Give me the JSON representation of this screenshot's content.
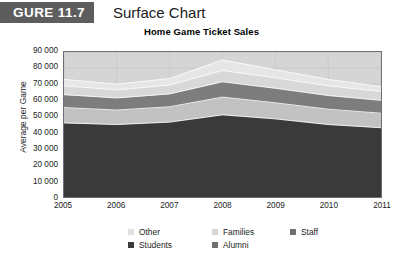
{
  "figure": {
    "number_label": "GURE 11.7",
    "title": "Surface Chart"
  },
  "chart_data": {
    "type": "area",
    "title": "Home Game Ticket Sales",
    "xlabel": "",
    "ylabel": "Average per Game",
    "categories": [
      "2005",
      "2006",
      "2007",
      "2008",
      "2009",
      "2010",
      "2011"
    ],
    "ylim": [
      0,
      90000
    ],
    "ytick_step": 10000,
    "yticks": [
      "0",
      "10 000",
      "20 000",
      "30 000",
      "40 000",
      "50 000",
      "60 000",
      "70 000",
      "80 000",
      "90 000"
    ],
    "grid": true,
    "legend_position": "bottom",
    "stack_order_bottom_to_top": [
      "Students",
      "Alumni",
      "Staff",
      "Families",
      "Other"
    ],
    "series": [
      {
        "name": "Students",
        "color": "#3a3a3a",
        "values": [
          46000,
          45000,
          46500,
          51000,
          48500,
          45000,
          43000
        ]
      },
      {
        "name": "Alumni",
        "color": "#c2c2c2",
        "values": [
          9500,
          9000,
          9500,
          11000,
          10000,
          9500,
          9000
        ]
      },
      {
        "name": "Staff",
        "color": "#7d7d7d",
        "values": [
          8000,
          7500,
          8000,
          9500,
          9000,
          8500,
          8000
        ]
      },
      {
        "name": "Families",
        "color": "#d8d8d8",
        "values": [
          5500,
          5000,
          5500,
          7000,
          6500,
          6000,
          5500
        ]
      },
      {
        "name": "Other",
        "color": "#e6e6e6",
        "values": [
          4000,
          3500,
          4000,
          6500,
          5000,
          4000,
          3000
        ]
      }
    ],
    "totals": [
      73000,
      70000,
      73500,
      85000,
      79000,
      73000,
      68500
    ]
  },
  "legend": {
    "columns": [
      {
        "items": [
          {
            "label": "Other",
            "color": "#e0e0e0"
          },
          {
            "label": "Students",
            "color": "#3a3a3a"
          }
        ]
      },
      {
        "items": [
          {
            "label": "Families",
            "color": "#d6d6d6"
          },
          {
            "label": "Alumni",
            "color": "#6f6f6f"
          }
        ]
      },
      {
        "items": [
          {
            "label": "Staff",
            "color": "#707070"
          }
        ]
      }
    ]
  },
  "colors": {
    "figure_box_bg": "#5d5d5d",
    "plot_bg": "#d5d5d5",
    "plot_border": "#6f6f6f"
  }
}
